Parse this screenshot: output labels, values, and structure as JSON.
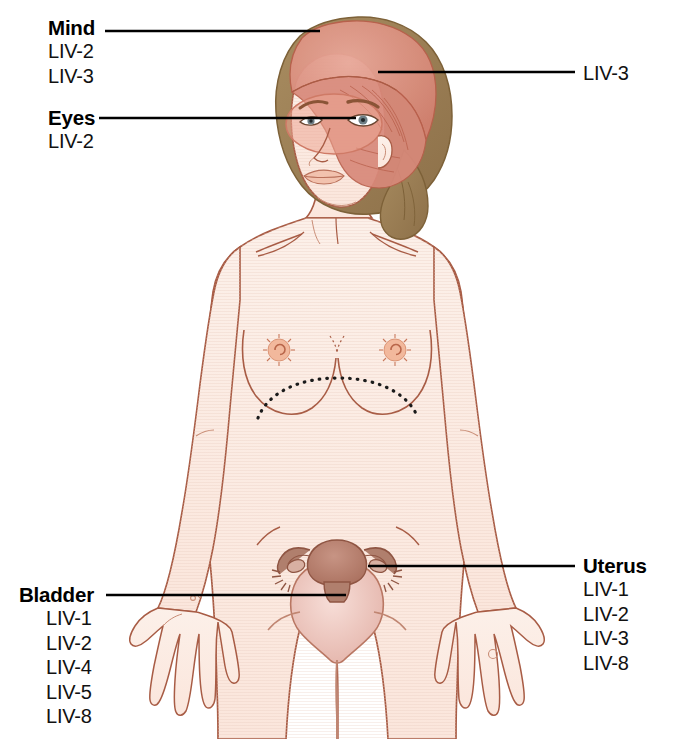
{
  "diagram": {
    "type": "acupuncture-point-indication-diagram",
    "background_color": "#ffffff"
  },
  "labels": {
    "mind": {
      "title": "Mind",
      "points": [
        "LIV-2",
        "LIV-3"
      ]
    },
    "eyes": {
      "title": "Eyes",
      "points": [
        "LIV-2"
      ]
    },
    "bladder": {
      "title": "Bladder",
      "points": [
        "LIV-1",
        "LIV-2",
        "LIV-4",
        "LIV-5",
        "LIV-8"
      ]
    },
    "uterus": {
      "title": "Uterus",
      "points": [
        "LIV-1",
        "LIV-2",
        "LIV-3",
        "LIV-8"
      ]
    },
    "head_point": {
      "title": "LIV-3"
    }
  },
  "colors": {
    "skin_fill": "#fbe9e0",
    "skin_outline": "#a85c45",
    "hair": "#9a7f55",
    "head_highlight": "#dd9384",
    "eye_highlight": "#eda594",
    "uterus": "#bf8474",
    "bladder": "#eec3bb",
    "leader_line": "#000000",
    "text": "#111111"
  }
}
